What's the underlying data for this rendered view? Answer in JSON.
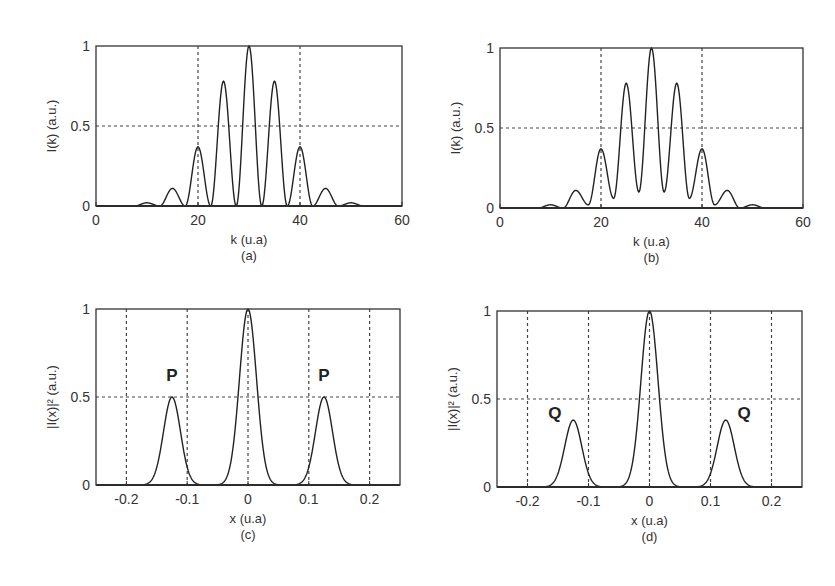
{
  "chart_data": [
    {
      "id": "a",
      "type": "line",
      "caption": "(a)",
      "xlabel": "k (u.a)",
      "ylabel": "I(k) (a.u.)",
      "xlim": [
        0,
        60
      ],
      "ylim": [
        0,
        1
      ],
      "xticks": [
        "0",
        "20",
        "40",
        "60"
      ],
      "yticks": [
        "0",
        "0.5",
        "1"
      ],
      "grid": {
        "x": [
          20,
          40
        ],
        "y": [
          0.5
        ],
        "style": "dashed"
      },
      "peaks": [
        {
          "x": 10,
          "y": 0.02
        },
        {
          "x": 15,
          "y": 0.11
        },
        {
          "x": 20,
          "y": 0.37
        },
        {
          "x": 25,
          "y": 0.78
        },
        {
          "x": 30,
          "y": 1.0
        },
        {
          "x": 35,
          "y": 0.78
        },
        {
          "x": 40,
          "y": 0.37
        },
        {
          "x": 45,
          "y": 0.11
        },
        {
          "x": 50,
          "y": 0.02
        }
      ],
      "valleys": [
        {
          "x": 12.5,
          "y": 0.0
        },
        {
          "x": 17.5,
          "y": 0.0
        },
        {
          "x": 22.5,
          "y": 0.0
        },
        {
          "x": 27.5,
          "y": 0.0
        },
        {
          "x": 32.5,
          "y": 0.0
        },
        {
          "x": 37.5,
          "y": 0.0
        },
        {
          "x": 42.5,
          "y": 0.0
        },
        {
          "x": 47.5,
          "y": 0.0
        }
      ],
      "peak_halfwidth": 2.3
    },
    {
      "id": "b",
      "type": "line",
      "caption": "(b)",
      "xlabel": "k (u.a)",
      "ylabel": "I(k) (a.u.)",
      "xlim": [
        0,
        60
      ],
      "ylim": [
        0,
        1
      ],
      "xticks": [
        "0",
        "20",
        "40",
        "60"
      ],
      "yticks": [
        "0",
        "0.5",
        "1"
      ],
      "grid": {
        "x": [
          20,
          40
        ],
        "y": [
          0.5
        ],
        "style": "dashed"
      },
      "peaks": [
        {
          "x": 10,
          "y": 0.02
        },
        {
          "x": 15,
          "y": 0.11
        },
        {
          "x": 20,
          "y": 0.37
        },
        {
          "x": 25,
          "y": 0.78
        },
        {
          "x": 30,
          "y": 1.0
        },
        {
          "x": 35,
          "y": 0.78
        },
        {
          "x": 40,
          "y": 0.37
        },
        {
          "x": 45,
          "y": 0.11
        },
        {
          "x": 50,
          "y": 0.02
        }
      ],
      "valleys": [
        {
          "x": 12.5,
          "y": 0.0
        },
        {
          "x": 17.5,
          "y": 0.02
        },
        {
          "x": 22.5,
          "y": 0.06
        },
        {
          "x": 27.5,
          "y": 0.1
        },
        {
          "x": 32.5,
          "y": 0.1
        },
        {
          "x": 37.5,
          "y": 0.06
        },
        {
          "x": 42.5,
          "y": 0.02
        },
        {
          "x": 47.5,
          "y": 0.0
        }
      ],
      "peak_halfwidth": 2.5
    },
    {
      "id": "c",
      "type": "line",
      "caption": "(c)",
      "xlabel": "x (u.a)",
      "ylabel": "|I(x)|² (a.u.)",
      "xlim": [
        -0.25,
        0.25
      ],
      "ylim": [
        0,
        1
      ],
      "xticks": [
        "-0.2",
        "-0.1",
        "0",
        "0.1",
        "0.2"
      ],
      "yticks": [
        "0",
        "0.5",
        "1"
      ],
      "grid": {
        "x": [
          -0.2,
          -0.1,
          0,
          0.1,
          0.2
        ],
        "y": [
          0.5
        ],
        "style": "dashed"
      },
      "peaks": [
        {
          "x": -0.125,
          "y": 0.5,
          "sigma": 0.014
        },
        {
          "x": 0.0,
          "y": 1.0,
          "sigma": 0.014
        },
        {
          "x": 0.125,
          "y": 0.5,
          "sigma": 0.014
        }
      ],
      "annotations": [
        {
          "text": "P",
          "x": -0.125,
          "y": 0.6
        },
        {
          "text": "P",
          "x": 0.125,
          "y": 0.6
        }
      ]
    },
    {
      "id": "d",
      "type": "line",
      "caption": "(d)",
      "xlabel": "x (u.a)",
      "ylabel": "|I(x)|² (a.u.)",
      "xlim": [
        -0.25,
        0.25
      ],
      "ylim": [
        0,
        1
      ],
      "xticks": [
        "-0.2",
        "-0.1",
        "0",
        "0.1",
        "0.2"
      ],
      "yticks": [
        "0",
        "0.5",
        "1"
      ],
      "grid": {
        "x": [
          -0.2,
          -0.1,
          0,
          0.1,
          0.2
        ],
        "y": [
          0.5
        ],
        "style": "dashed"
      },
      "peaks": [
        {
          "x": -0.125,
          "y": 0.38,
          "sigma": 0.014
        },
        {
          "x": 0.0,
          "y": 1.0,
          "sigma": 0.014
        },
        {
          "x": 0.125,
          "y": 0.38,
          "sigma": 0.014
        }
      ],
      "annotations": [
        {
          "text": "Q",
          "x": -0.155,
          "y": 0.4
        },
        {
          "text": "Q",
          "x": 0.155,
          "y": 0.4
        }
      ]
    }
  ],
  "layout": {
    "line_color": "#222222",
    "grid_color": "#444444",
    "frame_color": "#333333",
    "panels": [
      {
        "id": "a",
        "left": 96,
        "top": 46,
        "right": 402,
        "bottom": 206
      },
      {
        "id": "b",
        "left": 500,
        "top": 48,
        "right": 803,
        "bottom": 208
      },
      {
        "id": "c",
        "left": 96,
        "top": 309,
        "right": 400,
        "bottom": 485
      },
      {
        "id": "d",
        "left": 497,
        "top": 311,
        "right": 802,
        "bottom": 487
      }
    ]
  }
}
